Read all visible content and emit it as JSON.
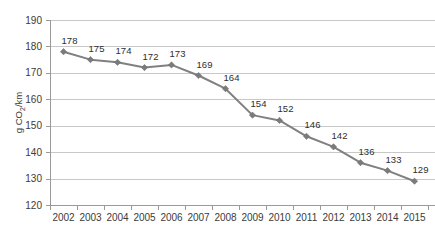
{
  "chart_data": {
    "type": "line",
    "title": "",
    "xlabel": "",
    "ylabel": "g CO2/km",
    "ylabel_parts": {
      "pre": "g CO",
      "sub": "2",
      "post": "/km"
    },
    "categories": [
      "2002",
      "2003",
      "2004",
      "2005",
      "2006",
      "2007",
      "2008",
      "2009",
      "2010",
      "2011",
      "2012",
      "2013",
      "2014",
      "2015"
    ],
    "values": [
      178,
      175,
      174,
      172,
      173,
      169,
      164,
      154,
      152,
      146,
      142,
      136,
      133,
      129
    ],
    "point_labels": [
      "178",
      "175",
      "174",
      "172",
      "173",
      "169",
      "164",
      "154",
      "152",
      "146",
      "142",
      "136",
      "133",
      "129"
    ],
    "ylim": [
      120,
      190
    ],
    "ytick_values": [
      120,
      130,
      140,
      150,
      160,
      170,
      180,
      190
    ],
    "ytick_labels": [
      "120",
      "130",
      "140",
      "150",
      "160",
      "170",
      "180",
      "190"
    ],
    "grid": true,
    "grid_axis": "y",
    "legend": false,
    "legend_position": "none",
    "series_color": "#808080",
    "marker_color": "#7b7b7b",
    "marker_shape": "diamond",
    "gridline_color": "#c8c8c8",
    "axis_color": "#9a9a9a",
    "text_color": "#3b3b3b",
    "background_color": "#ffffff"
  },
  "layout": {
    "plot_left": 50,
    "plot_right": 428,
    "plot_top": 20,
    "plot_bottom": 205
  }
}
